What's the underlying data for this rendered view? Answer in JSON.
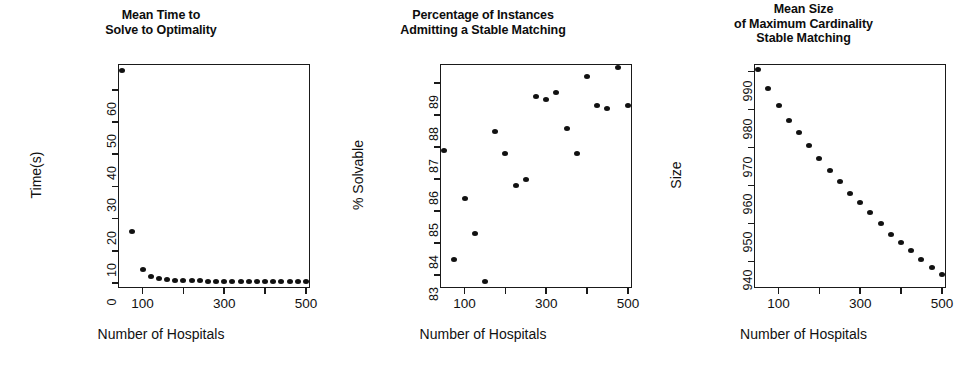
{
  "figure": {
    "width": 963,
    "height": 367,
    "background": "#ffffff",
    "ink_color": "#111111"
  },
  "chart_data": [
    {
      "type": "scatter",
      "title": "Mean Time to\nSolve to Optimality",
      "xlabel": "Number of Hospitals",
      "ylabel": "Time(s)",
      "xlim": [
        40,
        510
      ],
      "ylim": [
        -1.5,
        68
      ],
      "grid": false,
      "legend": "none",
      "xticks": [
        100,
        200,
        300,
        400,
        500
      ],
      "xticklabels": [
        "100",
        "",
        "300",
        "",
        "500"
      ],
      "yticks": [
        0,
        10,
        20,
        30,
        40,
        50,
        60
      ],
      "yticklabels": [
        "0",
        "10",
        "20",
        "30",
        "40",
        "50",
        "60"
      ],
      "x": [
        50,
        75,
        100,
        120,
        140,
        160,
        180,
        200,
        220,
        240,
        260,
        280,
        300,
        320,
        340,
        360,
        380,
        400,
        420,
        440,
        460,
        480,
        500
      ],
      "y": [
        66.0,
        16.0,
        4.2,
        2.0,
        1.4,
        1.1,
        0.9,
        0.8,
        0.7,
        0.7,
        0.6,
        0.6,
        0.6,
        0.5,
        0.5,
        0.5,
        0.5,
        0.4,
        0.4,
        0.4,
        0.4,
        0.4,
        0.4
      ]
    },
    {
      "type": "scatter",
      "title": "Percentage of Instances\nAdmitting a Stable Matching",
      "xlabel": "Number of Hospitals",
      "ylabel": "% Solvable",
      "xlim": [
        40,
        510
      ],
      "ylim": [
        82.6,
        89.6
      ],
      "grid": false,
      "legend": "none",
      "xticks": [
        100,
        200,
        300,
        400,
        500
      ],
      "xticklabels": [
        "100",
        "",
        "300",
        "",
        "500"
      ],
      "yticks": [
        83,
        84,
        85,
        86,
        87,
        88,
        89
      ],
      "yticklabels": [
        "83",
        "84",
        "85",
        "86",
        "87",
        "88",
        "89"
      ],
      "x": [
        50,
        75,
        100,
        125,
        150,
        175,
        200,
        225,
        250,
        275,
        300,
        325,
        350,
        375,
        400,
        425,
        450,
        475,
        500
      ],
      "y": [
        86.9,
        83.5,
        85.4,
        84.3,
        82.8,
        87.5,
        86.8,
        85.8,
        86.0,
        88.6,
        88.5,
        88.7,
        87.6,
        86.8,
        89.2,
        88.3,
        88.2,
        89.5,
        88.3,
        88.9
      ]
    },
    {
      "type": "scatter",
      "title": "Mean Size\nof Maximum Cardinality\nStable Matching",
      "xlabel": "Number of Hospitals",
      "ylabel": "Size",
      "xlim": [
        40,
        510
      ],
      "ylim": [
        933,
        992
      ],
      "grid": false,
      "legend": "none",
      "xticks": [
        100,
        200,
        300,
        400,
        500
      ],
      "xticklabels": [
        "100",
        "",
        "300",
        "",
        "500"
      ],
      "yticks": [
        940,
        950,
        960,
        970,
        980,
        990
      ],
      "yticklabels": [
        "940",
        "950",
        "960",
        "970",
        "980",
        "990"
      ],
      "x": [
        50,
        75,
        100,
        125,
        150,
        175,
        200,
        225,
        250,
        275,
        300,
        325,
        350,
        375,
        400,
        425,
        450,
        475,
        500
      ],
      "y": [
        990.5,
        985.5,
        981.0,
        977.0,
        974.0,
        970.5,
        967.0,
        964.0,
        961.0,
        958.0,
        955.5,
        953.0,
        950.0,
        947.0,
        945.0,
        943.0,
        940.5,
        938.5,
        936.5,
        934.5
      ]
    }
  ]
}
